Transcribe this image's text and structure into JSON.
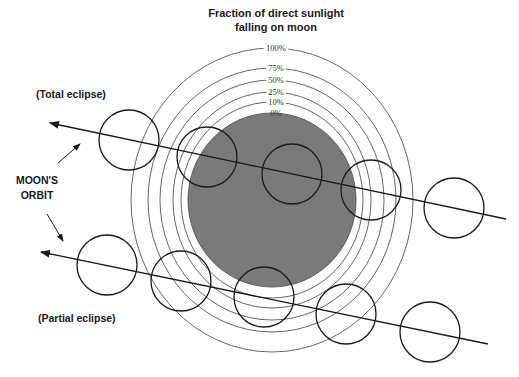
{
  "title": {
    "line1": "Fraction of direct sunlight",
    "line2": "falling on moon"
  },
  "labels": {
    "total_eclipse": "(Total eclipse)",
    "partial_eclipse": "(Partial eclipse)",
    "orbit_line1": "MOON'S",
    "orbit_line2": "ORBIT"
  },
  "shadow": {
    "center": [
      272,
      200
    ],
    "rings": [
      {
        "label": "100%",
        "rx": 141,
        "ry": 152
      },
      {
        "label": "75%",
        "rx": 124,
        "ry": 132
      },
      {
        "label": "50%",
        "rx": 112,
        "ry": 120
      },
      {
        "label": "25%",
        "rx": 99,
        "ry": 108
      },
      {
        "label": "10%",
        "rx": 91,
        "ry": 98
      },
      {
        "label": "0%",
        "rx": 84,
        "ry": 87
      }
    ],
    "umbra_color": "#7a7a7a"
  },
  "orbits": [
    {
      "name": "total-eclipse-path",
      "start": [
        50,
        123
      ],
      "end": [
        506,
        219
      ],
      "moons": [
        [
          129,
          140
        ],
        [
          207,
          157
        ],
        [
          292,
          174
        ],
        [
          371,
          190
        ],
        [
          454,
          208
        ]
      ]
    },
    {
      "name": "partial-eclipse-path",
      "start": [
        41,
        252
      ],
      "end": [
        488,
        344
      ],
      "moons": [
        [
          107,
          265
        ],
        [
          181,
          281
        ],
        [
          264,
          297
        ],
        [
          346,
          314
        ],
        [
          430,
          332
        ]
      ]
    }
  ],
  "moon_radius": 30,
  "colors": {
    "line": "#1a1a1a",
    "ring": "#555555",
    "background": "#ffffff"
  }
}
